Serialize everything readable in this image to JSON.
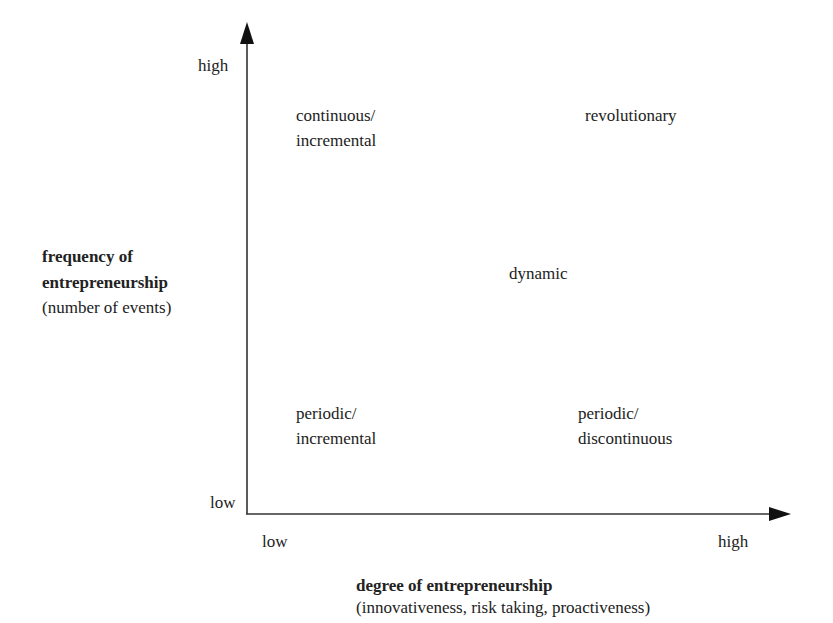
{
  "diagram": {
    "y_axis": {
      "title": "frequency of",
      "title_line2": "entrepreneurship",
      "subtitle": "(number of events)",
      "high_label": "high",
      "low_label": "low"
    },
    "x_axis": {
      "title": "degree of entrepreneurship",
      "subtitle": "(innovativeness, risk taking, proactiveness)",
      "low_label": "low",
      "high_label": "high"
    },
    "quadrants": {
      "top_left": {
        "line1": "continuous/",
        "line2": "incremental"
      },
      "top_right": {
        "line1": "revolutionary"
      },
      "center": {
        "line1": "dynamic"
      },
      "bottom_left": {
        "line1": "periodic/",
        "line2": "incremental"
      },
      "bottom_right": {
        "line1": "periodic/",
        "line2": "discontinuous"
      }
    },
    "colors": {
      "axis": "#333333",
      "text": "#222222"
    }
  }
}
